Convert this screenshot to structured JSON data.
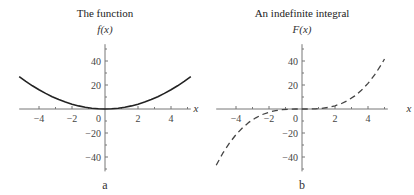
{
  "chart_data": [
    {
      "type": "line",
      "panel_label": "a",
      "title": "The function",
      "xlabel": "x",
      "ylabel": "f(x)",
      "xlim": [
        -5.2,
        5.2
      ],
      "ylim": [
        -52,
        54
      ],
      "xticks": [
        -4,
        -3,
        -2,
        -1,
        0,
        1,
        2,
        3,
        4,
        5
      ],
      "xtick_labels": [
        {
          "value": -4,
          "label": "−4"
        },
        {
          "value": -2,
          "label": "−2"
        },
        {
          "value": 2,
          "label": "2"
        },
        {
          "value": 4,
          "label": "4"
        }
      ],
      "origin_label": "0",
      "yticks": [
        -50,
        -40,
        -30,
        -20,
        -10,
        10,
        20,
        30,
        40,
        50
      ],
      "ytick_labels": [
        {
          "value": 40,
          "label": "40"
        },
        {
          "value": 20,
          "label": "20"
        },
        {
          "value": -20,
          "label": "−20"
        },
        {
          "value": -40,
          "label": "−40"
        }
      ],
      "series": [
        {
          "name": "f(x) = x^2",
          "style": "solid",
          "color": "#222222",
          "x": [
            -5.2,
            -4.8,
            -4.4,
            -4.0,
            -3.6,
            -3.2,
            -2.8,
            -2.4,
            -2.0,
            -1.6,
            -1.2,
            -0.8,
            -0.4,
            0.0,
            0.4,
            0.8,
            1.2,
            1.6,
            2.0,
            2.4,
            2.8,
            3.2,
            3.6,
            4.0,
            4.4,
            4.8,
            5.2
          ],
          "y": [
            27.04,
            23.04,
            19.36,
            16.0,
            12.96,
            10.24,
            7.84,
            5.76,
            4.0,
            2.56,
            1.44,
            0.64,
            0.16,
            0.0,
            0.16,
            0.64,
            1.44,
            2.56,
            4.0,
            5.76,
            7.84,
            10.24,
            12.96,
            16.0,
            19.36,
            23.04,
            27.04
          ]
        }
      ]
    },
    {
      "type": "line",
      "panel_label": "b",
      "title": "An indefinite integral",
      "xlabel": "x",
      "ylabel": "F(x)",
      "xlim": [
        -5.2,
        5.2
      ],
      "ylim": [
        -52,
        54
      ],
      "xticks": [
        -4,
        -3,
        -2,
        -1,
        0,
        1,
        2,
        3,
        4,
        5
      ],
      "xtick_labels": [
        {
          "value": -4,
          "label": "−4"
        },
        {
          "value": -2,
          "label": "−2"
        },
        {
          "value": 2,
          "label": "2"
        },
        {
          "value": 4,
          "label": "4"
        }
      ],
      "origin_label": "0",
      "yticks": [
        -50,
        -40,
        -30,
        -20,
        -10,
        10,
        20,
        30,
        40,
        50
      ],
      "ytick_labels": [
        {
          "value": 40,
          "label": "40"
        },
        {
          "value": 20,
          "label": "20"
        },
        {
          "value": -20,
          "label": "−20"
        },
        {
          "value": -40,
          "label": "−40"
        }
      ],
      "series": [
        {
          "name": "F(x) = x^3/3",
          "style": "dashed",
          "color": "#444444",
          "x": [
            -5.2,
            -4.8,
            -4.4,
            -4.0,
            -3.6,
            -3.2,
            -2.8,
            -2.4,
            -2.0,
            -1.6,
            -1.2,
            -0.8,
            -0.4,
            0.0,
            0.4,
            0.8,
            1.2,
            1.6,
            2.0,
            2.4,
            2.8,
            3.2,
            3.6,
            4.0,
            4.4,
            4.8,
            5.0
          ],
          "y": [
            -46.87,
            -36.86,
            -28.39,
            -21.33,
            -15.55,
            -10.92,
            -7.32,
            -4.61,
            -2.67,
            -1.37,
            -0.58,
            -0.17,
            -0.02,
            0.0,
            0.02,
            0.17,
            0.58,
            1.37,
            2.67,
            4.61,
            7.32,
            10.92,
            15.55,
            21.33,
            28.39,
            36.86,
            41.67
          ]
        }
      ]
    }
  ]
}
